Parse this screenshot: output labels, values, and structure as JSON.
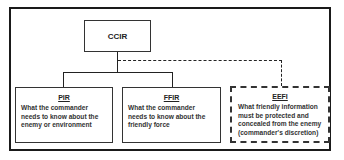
{
  "diagram": {
    "root": {
      "label": "CCIR"
    },
    "children": [
      {
        "id": "pir",
        "title": "PIR",
        "description": "What the commander needs to know about the enemy or environment",
        "border": "solid"
      },
      {
        "id": "ffir",
        "title": "FFIR",
        "description": "What the commander needs to know about the friendly force",
        "border": "solid"
      },
      {
        "id": "eefi",
        "title": "EEFI",
        "description": "What friendly information must be protected and concealed from the enemy (commander's discretion)",
        "border": "dashed"
      }
    ],
    "colors": {
      "line": "#222222",
      "background": "#ffffff",
      "text": "#333333"
    }
  }
}
